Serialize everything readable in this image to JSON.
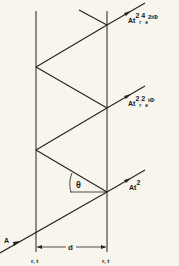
{
  "diagram": {
    "type": "Fabry-Perot multiple reflection ray diagram",
    "labels": {
      "incident": "A",
      "out1_base": "At",
      "out1_sup": "2",
      "out2_base": "At",
      "out2_sup1": "2",
      "out2_sub": "r",
      "out2_sup2": "2",
      "out2_e": "e",
      "out2_phase": "iΦ",
      "out3_base": "At",
      "out3_sup1": "2",
      "out3_sub": "r",
      "out3_sup2": "4",
      "out3_e": "e",
      "out3_phase": "2iΦ",
      "angle": "θ",
      "spacing": "d",
      "left_mirror": "r, t",
      "right_mirror": "r, t"
    },
    "colors": {
      "ink": "#1a1a1a",
      "paper": "#f7f5ec"
    }
  }
}
